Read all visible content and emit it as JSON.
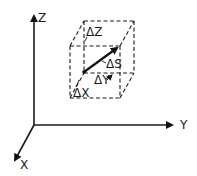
{
  "diagram": {
    "type": "3d-coordinate-box",
    "axes": {
      "z": {
        "label": "Z"
      },
      "y": {
        "label": "Y"
      },
      "x": {
        "label": "X"
      }
    },
    "box": {
      "labels": {
        "dz": "ΔZ",
        "ds": "ΔS",
        "dy": "ΔY",
        "dx": "ΔX"
      }
    },
    "colors": {
      "ink": "#1a1a1a",
      "background": "#ffffff"
    }
  }
}
